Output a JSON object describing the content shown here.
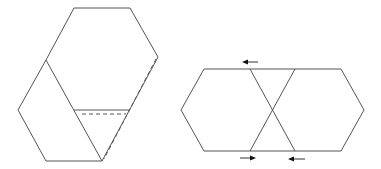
{
  "diagram": {
    "colors": {
      "line": "#555555",
      "arrow": "#111111",
      "background": "#ffffff"
    },
    "left_figure": {
      "description": "Large hexagon with a folded-over rhombus flap on its lower-left; dashed lines mark the hidden fold edges",
      "solid_paths": [
        "M74,8 L130,8 L158,57 L102,161 L46,161 L18,110 L46,60 Z",
        "M46,60 L102,161",
        "M74,110 L130,110"
      ],
      "dashed_paths": [
        "M156,59 L104,159",
        "M82,114 L126,114"
      ]
    },
    "right_figure": {
      "description": "Two hexagons joined along a strip, with crossing diagonal creases and arrows indicating folding directions",
      "solid_paths": [
        "M204,69 L341,69 L364,110 L341,151 L204,151 L181,110 Z",
        "M250,69 L295,151",
        "M295,69 L250,151"
      ],
      "arrows": [
        {
          "name": "top-arrow-left",
          "from": [
            258,
            62
          ],
          "to": [
            242,
            62
          ],
          "direction": "left"
        },
        {
          "name": "bottom-arrow-right",
          "from": [
            240,
            158
          ],
          "to": [
            256,
            158
          ],
          "direction": "right"
        },
        {
          "name": "bottom-arrow-left",
          "from": [
            305,
            159
          ],
          "to": [
            288,
            159
          ],
          "direction": "left"
        }
      ]
    }
  }
}
